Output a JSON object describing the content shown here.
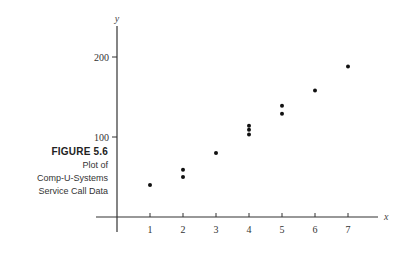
{
  "caption": {
    "figure_label": "FIGURE 5.6",
    "line1": "Plot of",
    "line2": "Comp-U-Systems",
    "line3": "Service Call Data"
  },
  "chart_data": {
    "type": "scatter",
    "title": "Plot of Comp-U-Systems Service Call Data",
    "xlabel": "x",
    "ylabel": "y",
    "x_ticks": [
      1,
      2,
      3,
      4,
      5,
      6,
      7
    ],
    "y_ticks": [
      100,
      200
    ],
    "xlim": [
      0,
      8
    ],
    "ylim": [
      0,
      240
    ],
    "grid": false,
    "points": [
      {
        "x": 1,
        "y": 40
      },
      {
        "x": 2,
        "y": 50
      },
      {
        "x": 2,
        "y": 59
      },
      {
        "x": 3,
        "y": 80
      },
      {
        "x": 4,
        "y": 103
      },
      {
        "x": 4,
        "y": 109
      },
      {
        "x": 4,
        "y": 114
      },
      {
        "x": 5,
        "y": 129
      },
      {
        "x": 5,
        "y": 139
      },
      {
        "x": 6,
        "y": 158
      },
      {
        "x": 7,
        "y": 188
      }
    ]
  }
}
